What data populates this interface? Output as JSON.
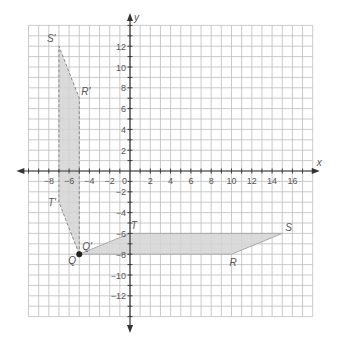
{
  "chart_data": {
    "type": "diagram",
    "title": "",
    "xlabel": "x",
    "ylabel": "y",
    "grid": true,
    "xlim": [
      -10,
      18
    ],
    "ylim": [
      -14,
      14
    ],
    "x_ticks": [
      -8,
      -6,
      -4,
      -2,
      0,
      2,
      4,
      6,
      8,
      10,
      12,
      14,
      16
    ],
    "y_ticks": [
      12,
      10,
      8,
      6,
      4,
      2,
      -2,
      -4,
      -6,
      -8,
      -10,
      -12
    ],
    "shapes": [
      {
        "name": "QRST",
        "style": "solid",
        "fill": "#d4d4d4",
        "vertices": [
          {
            "label": "Q",
            "x": -5,
            "y": -8
          },
          {
            "label": "R",
            "x": 10,
            "y": -8
          },
          {
            "label": "S",
            "x": 15,
            "y": -6
          },
          {
            "label": "T",
            "x": 0,
            "y": -6
          }
        ]
      },
      {
        "name": "Q'R'S'T'",
        "style": "dashed",
        "fill": "#d4d4d4",
        "vertices": [
          {
            "label": "Q'",
            "x": -5,
            "y": -8
          },
          {
            "label": "R'",
            "x": -5,
            "y": 7
          },
          {
            "label": "S'",
            "x": -7,
            "y": 12
          },
          {
            "label": "T'",
            "x": -7,
            "y": -3
          }
        ]
      }
    ],
    "points": [
      {
        "label": "Q",
        "x": -5,
        "y": -8,
        "marker": "filled-circle"
      }
    ]
  },
  "axes": {
    "x_label": "x",
    "y_label": "y",
    "origin_label": "0"
  },
  "colors": {
    "grid": "#bdbdbd",
    "axis": "#333333",
    "shape_fill": "#d4d4d4",
    "shape_stroke": "#aaaaaa",
    "text": "#555555"
  }
}
